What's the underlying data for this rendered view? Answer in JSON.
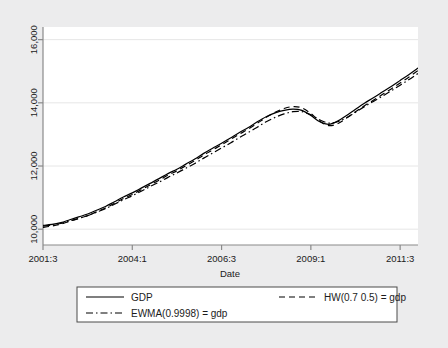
{
  "chart_data": {
    "type": "line",
    "title": "",
    "subtitle": "",
    "xlabel": "Date",
    "ylabel": "",
    "grid": true,
    "legend_position": "bottom",
    "xlim": [
      2001.5,
      2012.0
    ],
    "ylim": [
      9500,
      16400
    ],
    "y_ticks": [
      10000,
      12000,
      14000,
      16000
    ],
    "y_tick_labels": [
      "10,000",
      "12,000",
      "14,000",
      "16,000"
    ],
    "x_ticks": [
      2001.5,
      2004.0,
      2006.5,
      2009.0,
      2011.5
    ],
    "x_tick_labels": [
      "2001:3",
      "2004:1",
      "2006:3",
      "2009:1",
      "2011:3"
    ],
    "x": [
      2001.5,
      2001.75,
      2002.0,
      2002.25,
      2002.5,
      2002.75,
      2003.0,
      2003.25,
      2003.5,
      2003.75,
      2004.0,
      2004.25,
      2004.5,
      2004.75,
      2005.0,
      2005.25,
      2005.5,
      2005.75,
      2006.0,
      2006.25,
      2006.5,
      2006.75,
      2007.0,
      2007.25,
      2007.5,
      2007.75,
      2008.0,
      2008.25,
      2008.5,
      2008.75,
      2009.0,
      2009.25,
      2009.5,
      2009.75,
      2010.0,
      2010.25,
      2010.5,
      2010.75,
      2011.0,
      2011.25,
      2011.5,
      2011.75,
      2012.0
    ],
    "series": [
      {
        "name": "GDP",
        "style": "solid",
        "color": "#000000",
        "values": [
          10120,
          10150,
          10210,
          10300,
          10390,
          10480,
          10600,
          10720,
          10870,
          11020,
          11150,
          11300,
          11450,
          11600,
          11760,
          11900,
          12060,
          12220,
          12400,
          12560,
          12720,
          12890,
          13060,
          13220,
          13400,
          13560,
          13680,
          13760,
          13800,
          13760,
          13600,
          13400,
          13320,
          13420,
          13600,
          13800,
          13990,
          14160,
          14340,
          14520,
          14710,
          14900,
          15100
        ]
      },
      {
        "name": "HW(0.7 0.5) = gdp",
        "style": "dashed",
        "color": "#000000",
        "values": [
          10060,
          10100,
          10160,
          10250,
          10340,
          10430,
          10550,
          10670,
          10820,
          10970,
          11100,
          11250,
          11400,
          11550,
          11710,
          11850,
          12010,
          12170,
          12350,
          12510,
          12670,
          12840,
          13010,
          13170,
          13350,
          13540,
          13700,
          13820,
          13880,
          13840,
          13660,
          13420,
          13280,
          13340,
          13520,
          13720,
          13910,
          14080,
          14260,
          14440,
          14630,
          14820,
          15020
        ]
      },
      {
        "name": "EWMA(0.9998) = gdp",
        "style": "dashdot",
        "color": "#000000",
        "values": [
          10100,
          10130,
          10180,
          10260,
          10340,
          10430,
          10540,
          10650,
          10790,
          10930,
          11060,
          11200,
          11350,
          11490,
          11640,
          11780,
          11930,
          12080,
          12250,
          12410,
          12570,
          12730,
          12900,
          13060,
          13230,
          13400,
          13540,
          13650,
          13720,
          13720,
          13620,
          13460,
          13360,
          13400,
          13530,
          13700,
          13880,
          14040,
          14210,
          14380,
          14560,
          14740,
          14930
        ]
      }
    ],
    "legend": [
      {
        "label": "GDP",
        "style": "solid"
      },
      {
        "label": "HW(0.7 0.5) = gdp",
        "style": "dashed"
      },
      {
        "label": "EWMA(0.9998) = gdp",
        "style": "dashdot"
      }
    ]
  },
  "colors": {
    "page_background": "#ececed",
    "plot_background": "#ffffff",
    "axis": "#8a8a8a",
    "grid": "#e6e6e6",
    "line": "#000000",
    "text": "#1b1b1b"
  }
}
